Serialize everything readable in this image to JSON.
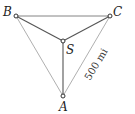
{
  "diagram": {
    "points": {
      "A": {
        "label": "A",
        "x": 63,
        "y": 96
      },
      "B": {
        "label": "B",
        "x": 16,
        "y": 16
      },
      "C": {
        "label": "C",
        "x": 110,
        "y": 16
      },
      "S": {
        "label": "S",
        "x": 63,
        "y": 41
      }
    },
    "edges": [
      {
        "from": "B",
        "to": "C",
        "style": "thin"
      },
      {
        "from": "B",
        "to": "A",
        "style": "light"
      },
      {
        "from": "C",
        "to": "A",
        "style": "light"
      },
      {
        "from": "B",
        "to": "S",
        "style": "dark"
      },
      {
        "from": "C",
        "to": "S",
        "style": "dark"
      },
      {
        "from": "S",
        "to": "A",
        "style": "dark"
      }
    ],
    "distance_label": "500 mi",
    "colors": {
      "dark": "#555555",
      "light": "#9a9a9a",
      "thin": "#777777"
    }
  }
}
